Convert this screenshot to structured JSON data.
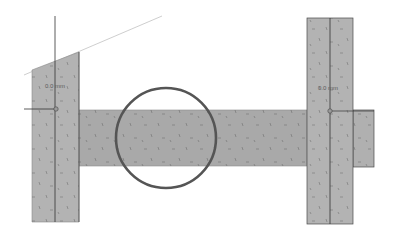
{
  "drawing": {
    "colors": {
      "fill": "#b3b3b3",
      "beam_fill": "#a9a9a9",
      "edge": "#4a4a4a",
      "thin_line": "#bdbdbd",
      "axis_line": "#333333",
      "highlight_circle": "#555555",
      "background": "#ffffff"
    },
    "left_column": {
      "label": "0.0 mm",
      "x": 32,
      "width": 47,
      "bottom": 222,
      "top_left_y": 70,
      "top_right_y": 52,
      "axis_x": 55
    },
    "right_column": {
      "label": "0.0 mm",
      "x": 307,
      "width": 46,
      "top": 18,
      "bottom": 224,
      "axis_x": 330
    },
    "beam": {
      "x": 79,
      "y": 110,
      "width": 228,
      "height": 56
    },
    "right_stub": {
      "x": 353,
      "y": 110,
      "width": 21,
      "height": 57
    },
    "roof_line": {
      "x1": 24,
      "y1": 75,
      "x2": 162,
      "y2": 16
    },
    "left_node": {
      "x": 56,
      "y": 109,
      "ref_line_x1": 24
    },
    "right_node": {
      "x": 330,
      "y": 111
    },
    "highlight_circle": {
      "cx": 166,
      "cy": 138,
      "r": 50
    }
  }
}
